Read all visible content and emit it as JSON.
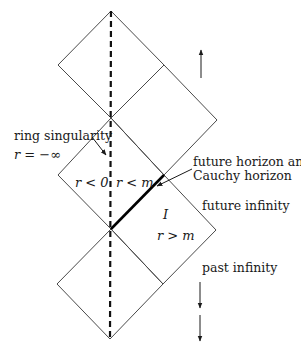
{
  "diagram": {
    "type": "Penrose diagram",
    "labels": {
      "ring_singularity": "ring singularity",
      "r_minus_infinity": "r = −∞",
      "r_less_0": "r < 0",
      "r_less_m": "r < m",
      "future_horizon_line1": "future horizon and",
      "future_horizon_line2": "Cauchy horizon",
      "future_infinity": "future infinity",
      "region_I": "I",
      "r_greater_m": "r > m",
      "past_infinity": "past infinity"
    },
    "colors": {
      "line": "#4a4a4a",
      "thick_line": "#000000",
      "text": "#1a1a1a",
      "background": "#ffffff"
    },
    "vertices": {
      "top_apex": [
        111,
        11
      ],
      "top_left": [
        58,
        65
      ],
      "top_right": [
        164,
        65
      ],
      "upper_cross": [
        111,
        118
      ],
      "upper_right_vertex": [
        217,
        120
      ],
      "mid_left": [
        58,
        175
      ],
      "mid_right": [
        164,
        175
      ],
      "lower_cross": [
        111,
        229
      ],
      "lower_right_vertex": [
        216,
        230
      ],
      "bottom_left": [
        57,
        284
      ],
      "bottom_right": [
        163,
        284
      ],
      "bottom_apex": [
        110,
        339
      ]
    }
  }
}
